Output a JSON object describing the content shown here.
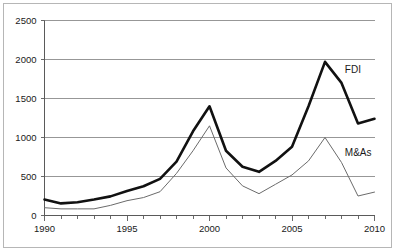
{
  "chart_data": {
    "type": "line",
    "title": "",
    "subtitle": "",
    "xlabel": "",
    "ylabel": "",
    "xlim": [
      1990,
      2010
    ],
    "ylim": [
      0,
      2500
    ],
    "grid": "horizontal",
    "legend_position": "inline-right",
    "x": [
      1990,
      1991,
      1992,
      1993,
      1994,
      1995,
      1996,
      1997,
      1998,
      1999,
      2000,
      2001,
      2002,
      2003,
      2004,
      2005,
      2006,
      2007,
      2008,
      2009,
      2010
    ],
    "ytick_labels": [
      "0",
      "500",
      "1000",
      "1500",
      "2000",
      "2500"
    ],
    "ytick_values": [
      0,
      500,
      1000,
      1500,
      2000,
      2500
    ],
    "xtick_labels": [
      "1990",
      "1995",
      "2000",
      "2005",
      "2010"
    ],
    "xtick_values": [
      1990,
      1995,
      2000,
      2005,
      2010
    ],
    "xtick_minor_values": [
      1991,
      1992,
      1993,
      1994,
      1996,
      1997,
      1998,
      1999,
      2001,
      2002,
      2003,
      2004,
      2006,
      2007,
      2008,
      2009
    ],
    "series": [
      {
        "name": "FDI",
        "label": "FDI",
        "color": "#111111",
        "width": 2.6,
        "label_x": 2008.2,
        "label_y": 1830,
        "values": [
          205,
          155,
          170,
          205,
          245,
          315,
          375,
          470,
          690,
          1080,
          1400,
          830,
          625,
          560,
          700,
          880,
          1400,
          1970,
          1700,
          1180,
          1240
        ]
      },
      {
        "name": "M&As",
        "label": "M&As",
        "color": "#6b6b6b",
        "width": 1.0,
        "label_x": 2008.2,
        "label_y": 760,
        "values": [
          100,
          85,
          85,
          85,
          130,
          190,
          230,
          305,
          540,
          830,
          1150,
          610,
          380,
          280,
          400,
          520,
          700,
          1000,
          680,
          250,
          300
        ]
      }
    ]
  }
}
